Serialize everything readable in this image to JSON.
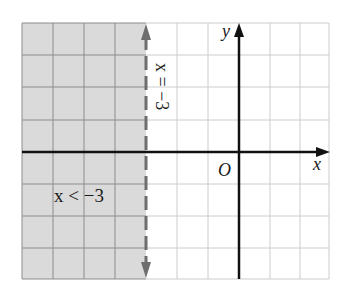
{
  "figure": {
    "type": "inequality-graph",
    "inequality_label": "x < −3",
    "boundary_label": "x = −3",
    "x_axis_label": "x",
    "y_axis_label": "y",
    "origin_label": "O",
    "boundary_x": -3,
    "boundary_style": "dashed",
    "shaded_side": "left",
    "grid": {
      "x_min": -7,
      "x_max": 3,
      "y_min": -4,
      "y_max": 4
    },
    "colors": {
      "shade": "#d9d9d9",
      "grid_shaded": "#8a8a8a",
      "grid_unshaded": "#cfcfcf",
      "axis": "#111111",
      "boundary": "#6e6e6e"
    }
  }
}
